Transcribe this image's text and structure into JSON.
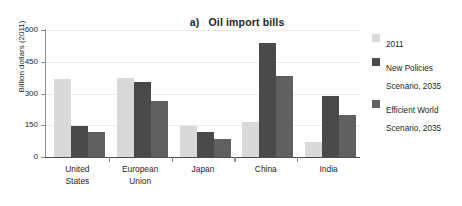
{
  "chart_data": {
    "type": "bar",
    "title_index": "a)",
    "title_text": "Oil import bills",
    "xlabel": "",
    "ylabel": "Billion dollars (2011)",
    "ylim": [
      0,
      600
    ],
    "yticks": [
      0,
      150,
      300,
      450,
      600
    ],
    "ytick_labels": [
      "0",
      "150",
      "300",
      "450",
      "600"
    ],
    "grid": true,
    "grid_axis": "y",
    "legend_position": "right",
    "categories": [
      "United States",
      "European Union",
      "Japan",
      "China",
      "India"
    ],
    "category_lines": [
      [
        "United",
        "States"
      ],
      [
        "European",
        "Union"
      ],
      [
        "Japan"
      ],
      [
        "China"
      ],
      [
        "India"
      ]
    ],
    "series": [
      {
        "name": "2011",
        "color": "#d9d9d9",
        "values": [
          370,
          375,
          147,
          165,
          70
        ]
      },
      {
        "name": "New Policies Scenario, 2035",
        "color": "#4a4a4a",
        "values": [
          145,
          355,
          120,
          538,
          287
        ]
      },
      {
        "name": "Efficient World Scenario, 2035",
        "color": "#606060",
        "values": [
          117,
          265,
          85,
          383,
          198
        ]
      }
    ]
  },
  "legend": {
    "items": [
      {
        "label": "2011",
        "color": "#d9d9d9"
      },
      {
        "label": "New Policies\nScenario, 2035",
        "color": "#4a4a4a"
      },
      {
        "label": "Efficient World\nScenario, 2035",
        "color": "#606060"
      }
    ]
  },
  "axis": {
    "y_title": "Billion dollars (2011)"
  },
  "colors": {
    "axis_line": "#4d4d4d",
    "gridline": "#ededed",
    "text": "#231f20",
    "background": "#ffffff"
  }
}
